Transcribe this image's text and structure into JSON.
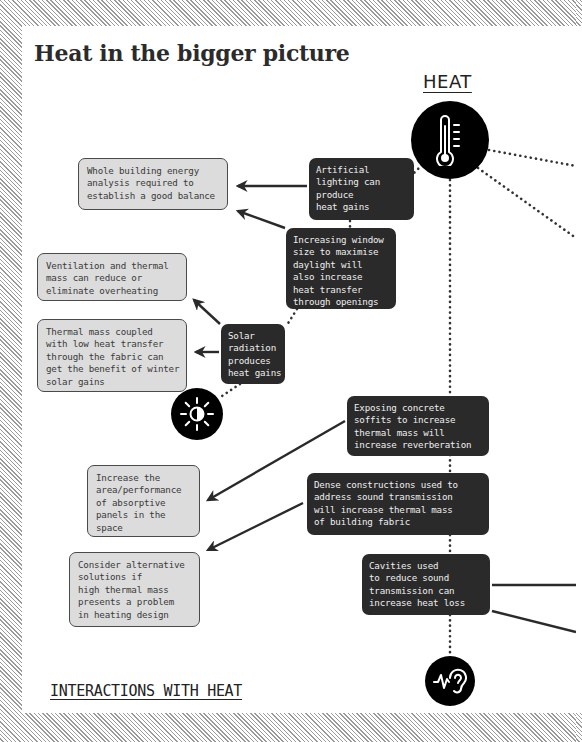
{
  "title": "Heat in the bigger picture",
  "heat_label": "HEAT",
  "footer_label": "INTERACTIONS WITH HEAT",
  "icons": {
    "heat": "thermometer-icon",
    "solar": "sun-icon",
    "acoustic": "ear-sound-wave-icon"
  },
  "colors": {
    "dark_box": "#2a2a2a",
    "light_box": "#dcdcdc",
    "circle": "#000000",
    "border_hatch": "#9a9a9a"
  },
  "dark_boxes": [
    {
      "id": "artificial-lighting",
      "text": "Artificial\nlighting can\nproduce\nheat gains"
    },
    {
      "id": "window-size",
      "text": "Increasing window\nsize to maximise\ndaylight will\nalso increase\nheat transfer\nthrough openings"
    },
    {
      "id": "solar-radiation",
      "text": "Solar\nradiation\nproduces\nheat gains"
    },
    {
      "id": "exposing-concrete",
      "text": "Exposing concrete\nsoffits to increase\nthermal mass will\nincrease reverberation"
    },
    {
      "id": "dense-constructions",
      "text": "Dense constructions used to\naddress sound transmission\nwill increase thermal mass\nof building fabric"
    },
    {
      "id": "cavities",
      "text": "Cavities used\nto reduce sound\ntransmission can\nincrease heat loss"
    }
  ],
  "light_boxes": [
    {
      "id": "whole-building",
      "text": "Whole building energy\nanalysis required to\nestablish a good balance"
    },
    {
      "id": "ventilation",
      "text": "Ventilation and thermal\nmass can reduce or\neliminate overheating"
    },
    {
      "id": "thermal-mass-coupled",
      "text": "Thermal mass coupled\nwith low heat transfer\nthrough the fabric can\nget the benefit of winter\nsolar gains"
    },
    {
      "id": "absorptive-panels",
      "text": "Increase the\narea/performance\nof absorptive\npanels in the\nspace"
    },
    {
      "id": "alternative-solutions",
      "text": "Consider alternative\nsolutions if\nhigh thermal mass\npresents a problem\nin heating design"
    }
  ]
}
